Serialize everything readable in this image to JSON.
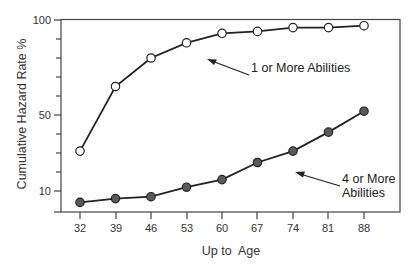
{
  "chart_data": {
    "type": "line",
    "title": "",
    "xlabel": "Up to  Age",
    "ylabel": "Cumulative Hazard Rate %",
    "categories": [
      "32",
      "39",
      "46",
      "53",
      "60",
      "67",
      "74",
      "81",
      "88"
    ],
    "x": [
      32,
      39,
      46,
      53,
      60,
      67,
      74,
      81,
      88
    ],
    "series": [
      {
        "name": "1 or More Abilities",
        "marker": "open-circle",
        "values": [
          31,
          65,
          80,
          88,
          93,
          94,
          96,
          96,
          97
        ]
      },
      {
        "name": "4 or More Abilities",
        "marker": "filled-circle",
        "values": [
          4,
          6,
          7,
          12,
          16,
          25,
          31,
          41,
          52
        ]
      }
    ],
    "yticks_labeled": [
      10,
      50,
      100
    ],
    "ylim": [
      -1,
      100
    ],
    "grid": false,
    "legend": "inline annotations with arrows",
    "annotations": [
      {
        "text": "1 or More Abilities",
        "points_to": "series 0 near x=60"
      },
      {
        "text_lines": [
          "4 or More",
          "Abilities"
        ],
        "points_to": "series 1 near x=67"
      }
    ]
  },
  "axis": {
    "y_tick_labels": [
      "100",
      "50",
      "10"
    ],
    "x_tick_labels": [
      "32",
      "39",
      "46",
      "53",
      "60",
      "67",
      "74",
      "81",
      "88"
    ],
    "xlabel": "Up to  Age",
    "ylabel": "Cumulative Hazard Rate %"
  },
  "annotations": {
    "one_or_more": "1 or More Abilities",
    "four_or_more_line1": "4 or More",
    "four_or_more_line2": "Abilities"
  },
  "colors": {
    "line": "#222222",
    "filled_marker": "#5a5a5a",
    "open_marker_fill": "#ffffff",
    "axis": "#444444"
  }
}
